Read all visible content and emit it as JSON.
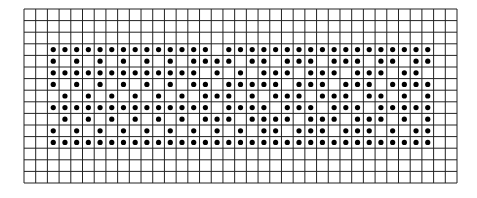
{
  "figure": {
    "type": "dot-grid pattern",
    "grid": {
      "columns": 37,
      "rows": 15,
      "left": 24,
      "top": 9,
      "right": 457,
      "bottom": 183,
      "line_color": "#222222",
      "background": "#ffffff"
    },
    "dot": {
      "color": "#000000",
      "radius": 2.6
    },
    "dot_rows": [
      {
        "row": 4,
        "cols": [
          3,
          4,
          5,
          6,
          7,
          8,
          9,
          10,
          11,
          12,
          13,
          14,
          15,
          16,
          18,
          19,
          20,
          21,
          22,
          23,
          24,
          25,
          26,
          27,
          28,
          29,
          30,
          31,
          32,
          33,
          34,
          35
        ]
      },
      {
        "row": 5,
        "cols": [
          3,
          5,
          7,
          9,
          11,
          13,
          15,
          16,
          17,
          18,
          20,
          21,
          23,
          24,
          25,
          27,
          28,
          29,
          31,
          32,
          34,
          35
        ]
      },
      {
        "row": 6,
        "cols": [
          3,
          4,
          5,
          6,
          7,
          8,
          9,
          10,
          11,
          12,
          13,
          14,
          15,
          17,
          19,
          21,
          22,
          23,
          25,
          26,
          27,
          29,
          30,
          31,
          33,
          34
        ]
      },
      {
        "row": 7,
        "cols": [
          3,
          5,
          7,
          9,
          11,
          13,
          15,
          16,
          18,
          19,
          20,
          21,
          22,
          24,
          25,
          26,
          28,
          29,
          30,
          32,
          33,
          34,
          35
        ]
      },
      {
        "row": 8,
        "cols": [
          4,
          6,
          8,
          10,
          12,
          14,
          16,
          17,
          18,
          20,
          22,
          23,
          24,
          26,
          27,
          28,
          30,
          31,
          33,
          35
        ]
      },
      {
        "row": 9,
        "cols": [
          3,
          4,
          5,
          6,
          7,
          8,
          9,
          10,
          11,
          12,
          13,
          14,
          15,
          16,
          18,
          19,
          20,
          21,
          23,
          24,
          25,
          27,
          28,
          29,
          31,
          32,
          33,
          34,
          35
        ]
      },
      {
        "row": 10,
        "cols": [
          4,
          6,
          8,
          10,
          12,
          14,
          16,
          17,
          18,
          20,
          21,
          22,
          23,
          25,
          26,
          27,
          29,
          30,
          31,
          33,
          35
        ]
      },
      {
        "row": 11,
        "cols": [
          3,
          5,
          7,
          9,
          11,
          13,
          15,
          17,
          19,
          21,
          22,
          24,
          25,
          26,
          28,
          29,
          30,
          32,
          34,
          35
        ]
      },
      {
        "row": 12,
        "cols": [
          3,
          4,
          5,
          6,
          7,
          8,
          9,
          10,
          11,
          12,
          13,
          14,
          15,
          16,
          17,
          18,
          19,
          20,
          21,
          22,
          23,
          24,
          25,
          26,
          27,
          28,
          29,
          30,
          31,
          32,
          33,
          34,
          35
        ]
      }
    ]
  }
}
